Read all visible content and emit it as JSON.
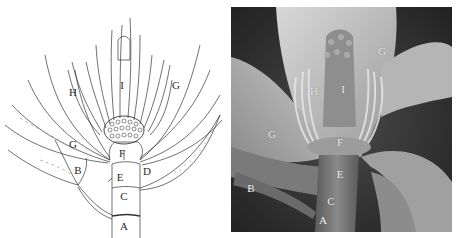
{
  "figure": {
    "panels": [
      {
        "id": "drawing",
        "kind": "line-drawing",
        "subject": "magnolia flower longitudinal structure",
        "labels": [
          {
            "text": "I",
            "x": 122,
            "y": 85
          },
          {
            "text": "H",
            "x": 73,
            "y": 92
          },
          {
            "text": "G",
            "x": 176,
            "y": 85
          },
          {
            "text": "G",
            "x": 73,
            "y": 144
          },
          {
            "text": "F",
            "x": 122,
            "y": 153
          },
          {
            "text": "B",
            "x": 78,
            "y": 170
          },
          {
            "text": "E",
            "x": 120,
            "y": 177
          },
          {
            "text": "D",
            "x": 147,
            "y": 171
          },
          {
            "text": "C",
            "x": 124,
            "y": 196
          },
          {
            "text": "A",
            "x": 124,
            "y": 226
          }
        ]
      },
      {
        "id": "photo",
        "kind": "grayscale-photograph",
        "subject": "magnolia flower",
        "labels": [
          {
            "text": "G",
            "x": 151,
            "y": 44
          },
          {
            "text": "H",
            "x": 83,
            "y": 84
          },
          {
            "text": "I",
            "x": 112,
            "y": 82
          },
          {
            "text": "G",
            "x": 41,
            "y": 127
          },
          {
            "text": "F",
            "x": 109,
            "y": 135
          },
          {
            "text": "E",
            "x": 109,
            "y": 167
          },
          {
            "text": "B",
            "x": 20,
            "y": 181
          },
          {
            "text": "C",
            "x": 100,
            "y": 194
          },
          {
            "text": "A",
            "x": 92,
            "y": 213
          }
        ]
      }
    ],
    "colors": {
      "background": "#ffffff",
      "ink": "#2a2a2a",
      "photo_dark": "#2e2e2e",
      "photo_petal": "#bdbdbd",
      "photo_label": "#f2f2f2"
    }
  }
}
